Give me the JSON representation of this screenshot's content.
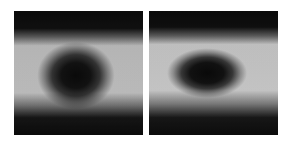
{
  "figure": {
    "kind": "scanned-grayscale-image-pair",
    "background_color": "#ffffff",
    "width": 291,
    "height": 148,
    "caption": "",
    "render": {
      "noise_amplitude": 0.42,
      "halftone": true,
      "grain_scale": 1
    },
    "panels": [
      {
        "id": "panel-left",
        "label": "",
        "x": 14,
        "y": 11,
        "width": 129,
        "height": 124,
        "border_color": "#000000",
        "min_gray": "#070707",
        "max_gray": "#f2f2f2",
        "blob": {
          "shape": "circular",
          "center_x": 0.475,
          "center_y": 0.525,
          "radius_x": 0.225,
          "radius_y": 0.215,
          "darkness": 1.0,
          "softness": 0.55
        },
        "halo": {
          "present": true,
          "brightness": 0.92,
          "inner_radius": 0.26,
          "outer_radius": 0.55
        },
        "bands": [
          {
            "name": "top-dark-band",
            "start": 0.0,
            "end": 0.19,
            "level": 0.06
          },
          {
            "name": "upper-falloff",
            "start": 0.19,
            "end": 0.25,
            "level": 0.45
          },
          {
            "name": "bright-midband",
            "start": 0.25,
            "end": 0.74,
            "level": 0.91
          },
          {
            "name": "lower-falloff",
            "start": 0.74,
            "end": 0.83,
            "level": 0.45
          },
          {
            "name": "bottom-dark-band",
            "start": 0.83,
            "end": 1.0,
            "level": 0.07
          }
        ],
        "secondary_lobe": {
          "present": true,
          "center_x": 0.5,
          "center_y": 0.8,
          "radius_x": 0.18,
          "radius_y": 0.1,
          "brightness": 0.3
        }
      },
      {
        "id": "panel-right",
        "label": "",
        "x": 149,
        "y": 11,
        "width": 129,
        "height": 124,
        "border_color": "#000000",
        "min_gray": "#060606",
        "max_gray": "#f4f4f4",
        "blob": {
          "shape": "elliptical-horizontal",
          "center_x": 0.45,
          "center_y": 0.505,
          "radius_x": 0.255,
          "radius_y": 0.15,
          "darkness": 1.0,
          "softness": 0.5
        },
        "halo": {
          "present": true,
          "brightness": 0.95,
          "inner_radius": 0.24,
          "outer_radius": 0.58
        },
        "bands": [
          {
            "name": "top-dark-band",
            "start": 0.0,
            "end": 0.18,
            "level": 0.05
          },
          {
            "name": "upper-falloff",
            "start": 0.18,
            "end": 0.24,
            "level": 0.45
          },
          {
            "name": "bright-midband",
            "start": 0.24,
            "end": 0.72,
            "level": 0.93
          },
          {
            "name": "lower-falloff",
            "start": 0.72,
            "end": 0.83,
            "level": 0.45
          },
          {
            "name": "bottom-dark-band",
            "start": 0.83,
            "end": 1.0,
            "level": 0.06
          }
        ],
        "secondary_lobe": {
          "present": true,
          "center_x": 0.47,
          "center_y": 0.815,
          "radius_x": 0.2,
          "radius_y": 0.115,
          "brightness": 0.55
        }
      }
    ]
  }
}
